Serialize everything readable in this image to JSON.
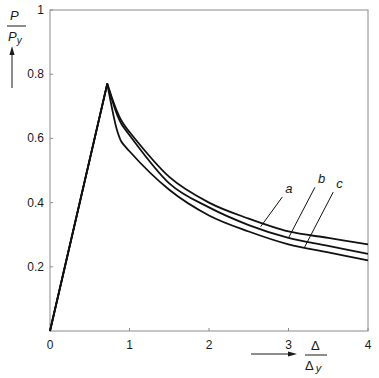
{
  "chart_data": {
    "type": "line",
    "title": "",
    "xlabel": "Δ / Δy",
    "ylabel": "P / Py",
    "xlim": [
      0,
      4
    ],
    "ylim": [
      0,
      1
    ],
    "x_ticks": [
      0,
      1,
      2,
      3,
      4
    ],
    "y_ticks": [
      0.2,
      0.4,
      0.6,
      0.8,
      1
    ],
    "y_tick_labels": [
      "0.2",
      "0.4",
      "0.6",
      "0.8",
      "1"
    ],
    "x_tick_labels": [
      "0",
      "1",
      "2",
      "3",
      "4"
    ],
    "grid": false,
    "legend": "inline labels with leader lines",
    "series": [
      {
        "name": "a",
        "x": [
          0,
          0.72,
          0.85,
          1.0,
          1.5,
          2.0,
          2.5,
          3.0,
          3.5,
          4.0
        ],
        "y": [
          0,
          0.77,
          0.68,
          0.62,
          0.48,
          0.4,
          0.35,
          0.31,
          0.29,
          0.27
        ]
      },
      {
        "name": "b",
        "x": [
          0,
          0.72,
          0.85,
          1.0,
          1.5,
          2.0,
          2.5,
          3.0,
          3.5,
          4.0
        ],
        "y": [
          0,
          0.77,
          0.67,
          0.61,
          0.46,
          0.385,
          0.33,
          0.29,
          0.265,
          0.24
        ]
      },
      {
        "name": "c",
        "x": [
          0,
          0.72,
          0.85,
          1.0,
          1.5,
          2.0,
          2.5,
          3.0,
          3.5,
          4.0
        ],
        "y": [
          0,
          0.77,
          0.62,
          0.56,
          0.44,
          0.36,
          0.31,
          0.27,
          0.245,
          0.22
        ]
      }
    ],
    "annotations": [
      {
        "text": "a",
        "label_x": 2.96,
        "label_y": 0.43,
        "point_x": 2.65,
        "point_y": 0.325
      },
      {
        "text": "b",
        "label_x": 3.37,
        "label_y": 0.46,
        "point_x": 3.0,
        "point_y": 0.29
      },
      {
        "text": "c",
        "label_x": 3.6,
        "label_y": 0.445,
        "point_x": 3.2,
        "point_y": 0.26
      }
    ]
  },
  "labels": {
    "y_numer": "P",
    "y_denom": "P",
    "y_denom_sub": "y",
    "x_numer": "Δ",
    "x_denom": "Δ",
    "x_denom_sub": "y"
  }
}
